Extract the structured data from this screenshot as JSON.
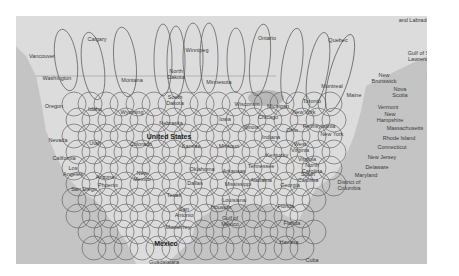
{
  "map": {
    "colors": {
      "ocean": "#c4c4c4",
      "land": "#dcdcdc",
      "land_dark": "#b8b8b8",
      "ellipse_stroke": "#555555",
      "label": "#3a3a3a"
    },
    "labels": [
      {
        "text": "and Labrador",
        "x": 399,
        "y": 4
      },
      {
        "text": "Vancouver",
        "x": 26,
        "y": 40
      },
      {
        "text": "Calgary",
        "x": 81,
        "y": 23
      },
      {
        "text": "Winnipeg",
        "x": 181,
        "y": 34
      },
      {
        "text": "Ontario",
        "x": 251,
        "y": 22
      },
      {
        "text": "Quebec",
        "x": 322,
        "y": 24
      },
      {
        "text": "Gulf of St.\nLawrence",
        "x": 404,
        "y": 40
      },
      {
        "text": "Washington",
        "x": 41,
        "y": 62
      },
      {
        "text": "North\nDakota",
        "x": 160,
        "y": 58
      },
      {
        "text": "Montana",
        "x": 116,
        "y": 64
      },
      {
        "text": "Minnesota",
        "x": 203,
        "y": 66
      },
      {
        "text": "New\nBrunswick",
        "x": 368,
        "y": 62
      },
      {
        "text": "Prince\nEdward\nIsland",
        "x": 420,
        "y": 62
      },
      {
        "text": "Montreal",
        "x": 316,
        "y": 70
      },
      {
        "text": "Maine",
        "x": 338,
        "y": 79
      },
      {
        "text": "Nova\nScotia",
        "x": 384,
        "y": 76
      },
      {
        "text": "South\nDakota",
        "x": 159,
        "y": 84
      },
      {
        "text": "Wisconsin",
        "x": 231,
        "y": 88
      },
      {
        "text": "Toronto",
        "x": 296,
        "y": 85
      },
      {
        "text": "Michigan",
        "x": 262,
        "y": 90
      },
      {
        "text": "Vermont",
        "x": 372,
        "y": 91
      },
      {
        "text": "Oregon",
        "x": 38,
        "y": 90
      },
      {
        "text": "Idaho",
        "x": 79,
        "y": 93
      },
      {
        "text": "Wyoming",
        "x": 116,
        "y": 96
      },
      {
        "text": "New York",
        "x": 288,
        "y": 96
      },
      {
        "text": "New\nHampshire",
        "x": 374,
        "y": 101
      },
      {
        "text": "Iowa",
        "x": 209,
        "y": 103
      },
      {
        "text": "Chicago",
        "x": 252,
        "y": 101
      },
      {
        "text": "Nebraska",
        "x": 155,
        "y": 107
      },
      {
        "text": "Illinois",
        "x": 235,
        "y": 111
      },
      {
        "text": "Ohio",
        "x": 276,
        "y": 114
      },
      {
        "text": "Pennsylvania",
        "x": 303,
        "y": 110
      },
      {
        "text": "Massachusetts",
        "x": 389,
        "y": 112
      },
      {
        "text": "Nevada",
        "x": 42,
        "y": 124
      },
      {
        "text": "Utah",
        "x": 79,
        "y": 127
      },
      {
        "text": "United States",
        "x": 153,
        "y": 121,
        "big": true
      },
      {
        "text": "Colorado",
        "x": 125,
        "y": 128
      },
      {
        "text": "Indiana",
        "x": 255,
        "y": 121
      },
      {
        "text": "New York",
        "x": 316,
        "y": 118
      },
      {
        "text": "Rhode Island",
        "x": 383,
        "y": 122
      },
      {
        "text": "Kansas",
        "x": 175,
        "y": 130
      },
      {
        "text": "Missouri",
        "x": 213,
        "y": 130
      },
      {
        "text": "West\nVirginia",
        "x": 284,
        "y": 131
      },
      {
        "text": "Connecticut",
        "x": 376,
        "y": 131
      },
      {
        "text": "California",
        "x": 48,
        "y": 142
      },
      {
        "text": "Kentucky",
        "x": 261,
        "y": 139
      },
      {
        "text": "Virginia",
        "x": 291,
        "y": 143
      },
      {
        "text": "New Jersey",
        "x": 366,
        "y": 141
      },
      {
        "text": "Tennessee",
        "x": 245,
        "y": 150
      },
      {
        "text": "North\nCarolina",
        "x": 296,
        "y": 152
      },
      {
        "text": "Delaware",
        "x": 361,
        "y": 151
      },
      {
        "text": "Los\nAngeles",
        "x": 57,
        "y": 155
      },
      {
        "text": "Oklahoma",
        "x": 186,
        "y": 153
      },
      {
        "text": "Arkansas",
        "x": 218,
        "y": 155
      },
      {
        "text": "Maryland",
        "x": 350,
        "y": 159
      },
      {
        "text": "Arizona",
        "x": 89,
        "y": 161
      },
      {
        "text": "New\nMexico",
        "x": 126,
        "y": 160
      },
      {
        "text": "Phoenix",
        "x": 92,
        "y": 169
      },
      {
        "text": "San Diego",
        "x": 68,
        "y": 173
      },
      {
        "text": "Dallas",
        "x": 179,
        "y": 167
      },
      {
        "text": "Mississippi",
        "x": 222,
        "y": 168
      },
      {
        "text": "Georgia",
        "x": 274,
        "y": 169
      },
      {
        "text": "South\nCarolina",
        "x": 292,
        "y": 161
      },
      {
        "text": "District of\nColumbia",
        "x": 333,
        "y": 169
      },
      {
        "text": "Alabama",
        "x": 245,
        "y": 164
      },
      {
        "text": "Texas",
        "x": 158,
        "y": 179
      },
      {
        "text": "Louisiana",
        "x": 218,
        "y": 184
      },
      {
        "text": "Houston",
        "x": 205,
        "y": 191
      },
      {
        "text": "San\nAntonio",
        "x": 168,
        "y": 196
      },
      {
        "text": "Florida",
        "x": 270,
        "y": 190
      },
      {
        "text": "Gulf of\nMexico",
        "x": 214,
        "y": 205
      },
      {
        "text": "Monterrey",
        "x": 162,
        "y": 211
      },
      {
        "text": "Florida",
        "x": 276,
        "y": 207
      },
      {
        "text": "Mexico",
        "x": 150,
        "y": 228,
        "big": true
      },
      {
        "text": "Havana",
        "x": 273,
        "y": 226
      },
      {
        "text": "Cuba",
        "x": 296,
        "y": 244
      },
      {
        "text": "Guadalajara",
        "x": 148,
        "y": 246
      }
    ],
    "tall_ellipses": [
      {
        "cx": 50,
        "cy": 44,
        "rx": 11,
        "ry": 31,
        "rot": -8
      },
      {
        "cx": 77,
        "cy": 50,
        "rx": 11,
        "ry": 34,
        "rot": -8
      },
      {
        "cx": 109,
        "cy": 46,
        "rx": 11,
        "ry": 35,
        "rot": -6
      },
      {
        "cx": 147,
        "cy": 44,
        "rx": 9,
        "ry": 36,
        "rot": 0
      },
      {
        "cx": 160,
        "cy": 46,
        "rx": 9,
        "ry": 36,
        "rot": 0
      },
      {
        "cx": 177,
        "cy": 42,
        "rx": 10,
        "ry": 35,
        "rot": 0
      },
      {
        "cx": 193,
        "cy": 42,
        "rx": 9,
        "ry": 35,
        "rot": 0
      },
      {
        "cx": 220,
        "cy": 44,
        "rx": 9,
        "ry": 32,
        "rot": 0
      },
      {
        "cx": 244,
        "cy": 44,
        "rx": 10,
        "ry": 36,
        "rot": 6
      },
      {
        "cx": 276,
        "cy": 50,
        "rx": 10,
        "ry": 38,
        "rot": 8
      },
      {
        "cx": 302,
        "cy": 54,
        "rx": 10,
        "ry": 38,
        "rot": 10
      },
      {
        "cx": 324,
        "cy": 57,
        "rx": 10,
        "ry": 40,
        "rot": 16
      }
    ],
    "grid_circles": {
      "columns_x": [
        58,
        74,
        90,
        106,
        122,
        138,
        154,
        170,
        186,
        202,
        218,
        234,
        250,
        266,
        282,
        298,
        314
      ],
      "rows_y": [
        88,
        104,
        120,
        136,
        152,
        168,
        184,
        200,
        216,
        232
      ],
      "r": 12
    }
  }
}
